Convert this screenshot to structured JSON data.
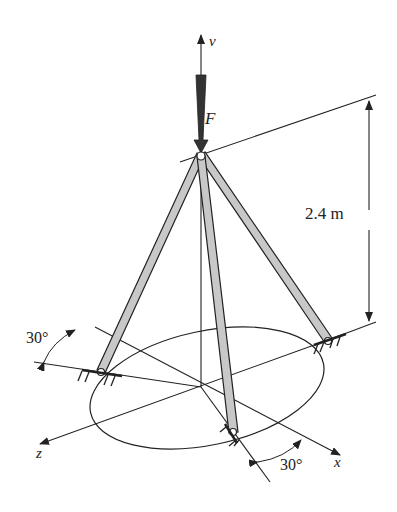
{
  "figure": {
    "type": "tripod-statics-diagram",
    "labels": {
      "v_axis": "v",
      "force": "F",
      "height": "2.4 m",
      "angle_left": "30°",
      "angle_bottom": "30°",
      "z_axis": "z",
      "x_axis": "x"
    },
    "colors": {
      "line": "#222222",
      "member_fill": "#c8c8c8",
      "background": "#ffffff"
    }
  }
}
